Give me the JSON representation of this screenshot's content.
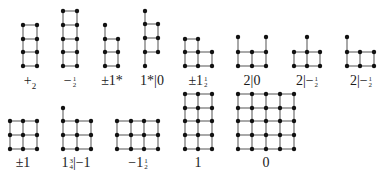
{
  "figure": {
    "stroke_color": "#7a7a7a",
    "node_color": "#111111",
    "graphs": [
      {
        "label": "+₂",
        "label_parts": {
          "main": "+",
          "sub": "2"
        },
        "label_pos": [
          30,
          81
        ],
        "nodes": [
          [
            23,
            25
          ],
          [
            37,
            25
          ],
          [
            23,
            39
          ],
          [
            37,
            39
          ],
          [
            23,
            52
          ],
          [
            37,
            52
          ],
          [
            23,
            66
          ],
          [
            37,
            66
          ]
        ],
        "edges": [
          [
            0,
            1
          ],
          [
            2,
            3
          ],
          [
            4,
            5
          ],
          [
            6,
            7
          ],
          [
            0,
            2
          ],
          [
            2,
            4
          ],
          [
            4,
            6
          ],
          [
            1,
            3
          ],
          [
            3,
            5
          ],
          [
            5,
            7
          ]
        ]
      },
      {
        "label": "−½",
        "label_parts": {
          "main": "−",
          "num": "1",
          "den": "2"
        },
        "label_pos": [
          70,
          81
        ],
        "nodes": [
          [
            63,
            11
          ],
          [
            77,
            11
          ],
          [
            63,
            25
          ],
          [
            77,
            25
          ],
          [
            63,
            39
          ],
          [
            77,
            39
          ],
          [
            63,
            52
          ],
          [
            77,
            52
          ],
          [
            63,
            66
          ],
          [
            77,
            66
          ]
        ],
        "edges": [
          [
            0,
            1
          ],
          [
            2,
            3
          ],
          [
            4,
            5
          ],
          [
            6,
            7
          ],
          [
            8,
            9
          ],
          [
            0,
            2
          ],
          [
            2,
            4
          ],
          [
            4,
            6
          ],
          [
            6,
            8
          ],
          [
            1,
            3
          ],
          [
            3,
            5
          ],
          [
            5,
            7
          ],
          [
            7,
            9
          ]
        ]
      },
      {
        "label": "±1*",
        "label_parts": {
          "main": "±1*"
        },
        "label_pos": [
          112,
          81
        ],
        "nodes": [
          [
            105,
            25
          ],
          [
            105,
            39
          ],
          [
            118,
            39
          ],
          [
            105,
            52
          ],
          [
            118,
            52
          ],
          [
            105,
            66
          ],
          [
            118,
            66
          ]
        ],
        "edges": [
          [
            0,
            1
          ],
          [
            1,
            3
          ],
          [
            3,
            5
          ],
          [
            2,
            4
          ],
          [
            4,
            6
          ],
          [
            1,
            2
          ],
          [
            3,
            4
          ],
          [
            5,
            6
          ]
        ]
      },
      {
        "label": "1*|0",
        "label_parts": {
          "main": "1*|0"
        },
        "label_pos": [
          152,
          81
        ],
        "nodes": [
          [
            145,
            11
          ],
          [
            145,
            24
          ],
          [
            158,
            24
          ],
          [
            145,
            38
          ],
          [
            158,
            38
          ],
          [
            145,
            52
          ],
          [
            158,
            52
          ],
          [
            145,
            66
          ]
        ],
        "edges": [
          [
            0,
            1
          ],
          [
            1,
            3
          ],
          [
            3,
            5
          ],
          [
            5,
            7
          ],
          [
            2,
            4
          ],
          [
            4,
            6
          ],
          [
            1,
            2
          ],
          [
            3,
            4
          ],
          [
            5,
            6
          ]
        ]
      },
      {
        "label": "±1½",
        "label_parts": {
          "main": "±1",
          "num": "1",
          "den": "2"
        },
        "label_pos": [
          198,
          81
        ],
        "nodes": [
          [
            185,
            39
          ],
          [
            198,
            39
          ],
          [
            185,
            52
          ],
          [
            198,
            52
          ],
          [
            212,
            52
          ],
          [
            185,
            66
          ],
          [
            198,
            66
          ],
          [
            212,
            66
          ]
        ],
        "edges": [
          [
            0,
            1
          ],
          [
            0,
            2
          ],
          [
            1,
            3
          ],
          [
            2,
            3
          ],
          [
            3,
            4
          ],
          [
            2,
            5
          ],
          [
            3,
            6
          ],
          [
            4,
            7
          ],
          [
            5,
            6
          ],
          [
            6,
            7
          ]
        ]
      },
      {
        "label": "2|0",
        "label_parts": {
          "main": "2|0"
        },
        "label_pos": [
          252,
          81
        ],
        "nodes": [
          [
            238,
            37
          ],
          [
            266,
            37
          ],
          [
            238,
            52
          ],
          [
            252,
            52
          ],
          [
            266,
            52
          ],
          [
            238,
            66
          ],
          [
            252,
            66
          ],
          [
            266,
            66
          ]
        ],
        "edges": [
          [
            0,
            2
          ],
          [
            1,
            4
          ],
          [
            2,
            3
          ],
          [
            3,
            4
          ],
          [
            2,
            5
          ],
          [
            3,
            6
          ],
          [
            4,
            7
          ],
          [
            5,
            6
          ],
          [
            6,
            7
          ]
        ]
      },
      {
        "label": "2|−½",
        "label_parts": {
          "main": "2|−",
          "num": "1",
          "den": "2"
        },
        "label_pos": [
          307,
          81
        ],
        "nodes": [
          [
            307,
            37
          ],
          [
            294,
            52
          ],
          [
            307,
            52
          ],
          [
            320,
            52
          ],
          [
            294,
            66
          ],
          [
            307,
            66
          ],
          [
            320,
            66
          ]
        ],
        "edges": [
          [
            0,
            2
          ],
          [
            1,
            2
          ],
          [
            2,
            3
          ],
          [
            1,
            4
          ],
          [
            2,
            5
          ],
          [
            3,
            6
          ],
          [
            4,
            5
          ],
          [
            5,
            6
          ]
        ]
      },
      {
        "label": "2|−½",
        "label_parts": {
          "main": "2|−",
          "num": "1",
          "den": "2"
        },
        "label_pos": [
          361,
          81
        ],
        "nodes": [
          [
            347,
            37
          ],
          [
            347,
            52
          ],
          [
            360,
            52
          ],
          [
            374,
            52
          ],
          [
            347,
            66
          ],
          [
            360,
            66
          ],
          [
            374,
            66
          ]
        ],
        "edges": [
          [
            0,
            1
          ],
          [
            1,
            2
          ],
          [
            2,
            3
          ],
          [
            1,
            4
          ],
          [
            2,
            5
          ],
          [
            3,
            6
          ],
          [
            4,
            5
          ],
          [
            5,
            6
          ]
        ]
      },
      {
        "label": "±1",
        "label_parts": {
          "main": "±1"
        },
        "label_pos": [
          23,
          163
        ],
        "nodes": [
          [
            10,
            121
          ],
          [
            23,
            121
          ],
          [
            37,
            121
          ],
          [
            10,
            135
          ],
          [
            23,
            135
          ],
          [
            37,
            135
          ],
          [
            10,
            149
          ],
          [
            23,
            149
          ],
          [
            37,
            149
          ]
        ],
        "edges": [
          [
            0,
            1
          ],
          [
            1,
            2
          ],
          [
            3,
            4
          ],
          [
            4,
            5
          ],
          [
            6,
            7
          ],
          [
            7,
            8
          ],
          [
            0,
            3
          ],
          [
            3,
            6
          ],
          [
            1,
            4
          ],
          [
            4,
            7
          ],
          [
            2,
            5
          ],
          [
            5,
            8
          ]
        ]
      },
      {
        "label": "1¾|−1",
        "label_parts": {
          "main": "1",
          "num": "3",
          "den": "4",
          "tail": "|−1"
        },
        "label_pos": [
          76,
          163
        ],
        "nodes": [
          [
            63,
            108
          ],
          [
            63,
            121
          ],
          [
            77,
            121
          ],
          [
            91,
            121
          ],
          [
            63,
            135
          ],
          [
            77,
            135
          ],
          [
            91,
            135
          ],
          [
            63,
            149
          ],
          [
            77,
            149
          ],
          [
            91,
            149
          ]
        ],
        "edges": [
          [
            0,
            1
          ],
          [
            1,
            2
          ],
          [
            2,
            3
          ],
          [
            4,
            5
          ],
          [
            5,
            6
          ],
          [
            7,
            8
          ],
          [
            8,
            9
          ],
          [
            1,
            4
          ],
          [
            4,
            7
          ],
          [
            2,
            5
          ],
          [
            5,
            8
          ],
          [
            3,
            6
          ],
          [
            6,
            9
          ]
        ]
      },
      {
        "label": "−1½",
        "label_parts": {
          "main": "−1",
          "num": "1",
          "den": "2"
        },
        "label_pos": [
          138,
          163
        ],
        "nodes": [
          [
            117,
            121
          ],
          [
            131,
            121
          ],
          [
            144,
            121
          ],
          [
            158,
            121
          ],
          [
            117,
            135
          ],
          [
            131,
            135
          ],
          [
            144,
            135
          ],
          [
            158,
            135
          ],
          [
            117,
            149
          ],
          [
            131,
            149
          ],
          [
            144,
            149
          ],
          [
            158,
            149
          ]
        ],
        "edges": [
          [
            0,
            1
          ],
          [
            1,
            2
          ],
          [
            2,
            3
          ],
          [
            4,
            5
          ],
          [
            5,
            6
          ],
          [
            6,
            7
          ],
          [
            8,
            9
          ],
          [
            9,
            10
          ],
          [
            10,
            11
          ],
          [
            0,
            4
          ],
          [
            4,
            8
          ],
          [
            1,
            5
          ],
          [
            5,
            9
          ],
          [
            2,
            6
          ],
          [
            6,
            10
          ],
          [
            3,
            7
          ],
          [
            7,
            11
          ]
        ]
      },
      {
        "label": "1",
        "label_parts": {
          "main": "1"
        },
        "label_pos": [
          198,
          163
        ],
        "grid": {
          "xs": [
            185,
            198,
            212
          ],
          "ys": [
            94,
            108,
            121,
            135,
            149
          ]
        }
      },
      {
        "label": "0",
        "label_parts": {
          "main": "0"
        },
        "label_pos": [
          266,
          163
        ],
        "grid": {
          "xs": [
            238,
            252,
            266,
            280,
            294
          ],
          "ys": [
            94,
            108,
            121,
            135,
            149
          ]
        }
      }
    ]
  }
}
